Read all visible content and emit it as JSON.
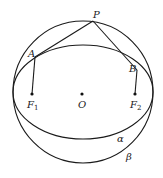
{
  "diagram": {
    "type": "geometry",
    "stroke_color": "#1a1a1a",
    "labels": {
      "P": "P",
      "A": "A",
      "B": "B",
      "F1": "F",
      "F1_sub": "1",
      "O": "O",
      "F2": "F",
      "F2_sub": "2",
      "alpha": "α",
      "beta": "β"
    },
    "points": {
      "P": [
        93,
        21
      ],
      "A": [
        35,
        57
      ],
      "B": [
        137,
        70
      ],
      "F1": [
        32,
        94
      ],
      "O": [
        82,
        94
      ],
      "F2": [
        135,
        94
      ]
    },
    "shapes": {
      "outer_circle_beta": {
        "cx": 83,
        "cy": 92,
        "rx": 70,
        "ry": 71
      },
      "inner_ellipse_alpha": {
        "cx": 83,
        "cy": 92,
        "rx": 70,
        "ry": 47
      }
    },
    "segments": [
      [
        "P",
        "A"
      ],
      [
        "P",
        "B"
      ],
      [
        "A",
        "F1"
      ],
      [
        "B",
        "F2"
      ]
    ]
  }
}
